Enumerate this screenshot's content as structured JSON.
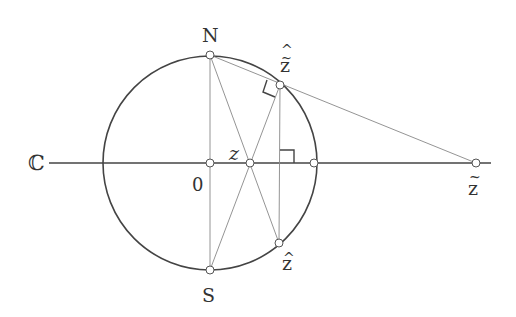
{
  "diagram": {
    "colors": {
      "circle": "#444444",
      "axis": "#444444",
      "construction": "#777777",
      "point_fill": "#ffffff",
      "point_stroke": "#555555",
      "label": "#333333"
    },
    "labels": {
      "plane": "ℂ",
      "north": "N",
      "south": "S",
      "origin": "0",
      "z": "z",
      "z_tilde": "z",
      "z_hat": "z",
      "z_tilde_hat": "z",
      "tilde_mark": "~",
      "hat_mark": "^"
    },
    "points": {
      "N": [
        210,
        55
      ],
      "S": [
        210,
        270
      ],
      "O": [
        210,
        163
      ],
      "z": [
        250,
        163
      ],
      "unit": [
        314,
        163
      ],
      "z_tilde": [
        476,
        163
      ],
      "z_hat": [
        279,
        243
      ],
      "z_tilde_hat": [
        280,
        85
      ]
    },
    "circle": {
      "cx": 210,
      "cy": 163,
      "r": 107
    },
    "axis": {
      "x1": 49,
      "x2": 491,
      "y": 163
    }
  }
}
